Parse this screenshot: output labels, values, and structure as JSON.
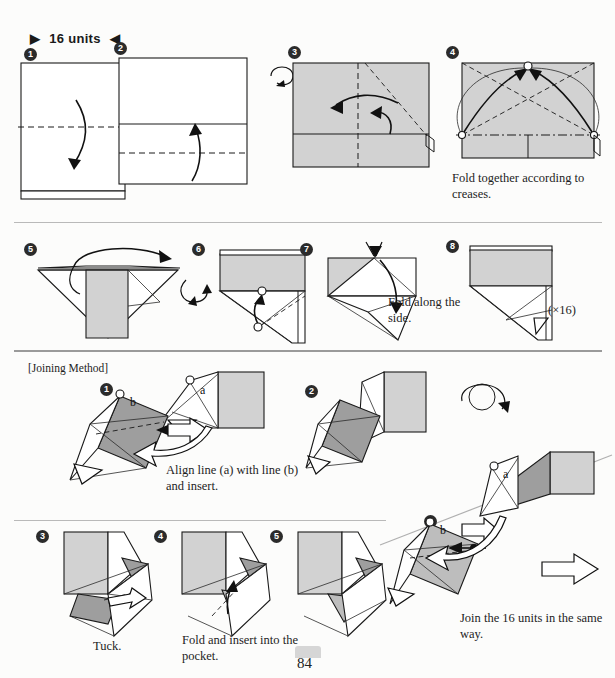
{
  "page": {
    "title": "16 units",
    "header_left_marker": "▶",
    "header_right_marker": "◀",
    "page_number": "84"
  },
  "sections": {
    "unit": {
      "steps": [
        {
          "num": "❶",
          "label": "1"
        },
        {
          "num": "❷",
          "label": "2"
        },
        {
          "num": "❸",
          "label": "3"
        },
        {
          "num": "❹",
          "label": "4"
        },
        {
          "num": "❺",
          "label": "5"
        },
        {
          "num": "❻",
          "label": "6"
        },
        {
          "num": "❼",
          "label": "7"
        },
        {
          "num": "❽",
          "label": "8"
        }
      ],
      "caption_step4": "Fold together according to creases.",
      "caption_step7": "Fold along the side.",
      "repeat_note": "(×16)"
    },
    "joining": {
      "heading": "[Joining Method]",
      "steps": [
        {
          "num": "❶",
          "label": "1"
        },
        {
          "num": "❷",
          "label": "2"
        },
        {
          "num": "❸",
          "label": "3"
        },
        {
          "num": "❹",
          "label": "4"
        },
        {
          "num": "❺",
          "label": "5"
        },
        {
          "num": "❻",
          "label": "6"
        }
      ],
      "caption_step1": "Align line (a) with line (b) and insert.",
      "caption_step3": "Tuck.",
      "caption_step4": "Fold and insert into the pocket.",
      "caption_step6": "Join the 16 units in the same way.",
      "marker_a": "a",
      "marker_b": "b"
    }
  },
  "colors": {
    "ink": "#1a1a1a",
    "paper_front": "#ffffff",
    "paper_back_light": "#d2d2d2",
    "paper_back_mid": "#bdbdbd",
    "paper_back_dark": "#9e9e9e",
    "rule": "#b9b9b9"
  }
}
